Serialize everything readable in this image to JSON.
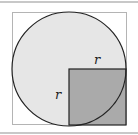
{
  "diagram": {
    "labels": {
      "top_radius": "r",
      "left_radius": "r"
    },
    "colors": {
      "circle_fill": "#e6e6e6",
      "square_fill": "#aaaaaa",
      "outline": "#222222",
      "frame": "#b4b4b4",
      "rule": "#c8c8c8"
    }
  }
}
